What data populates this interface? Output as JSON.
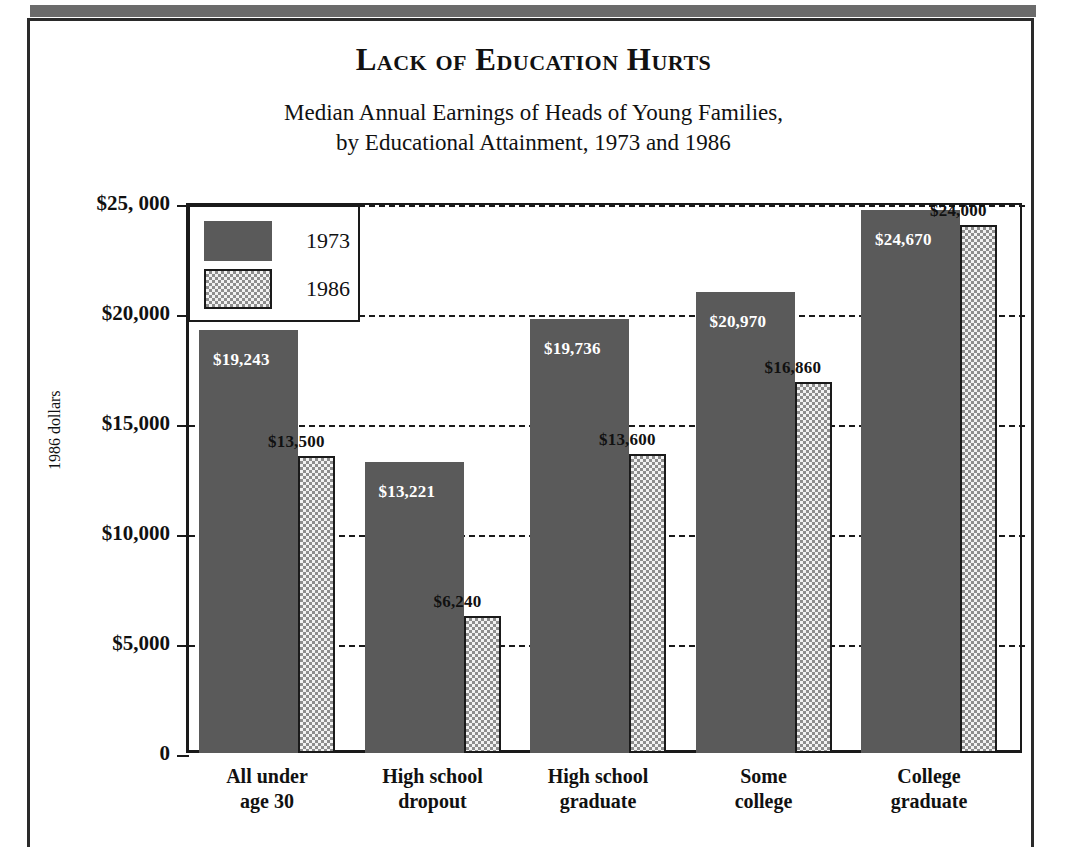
{
  "figure": {
    "title": "Lack of Education Hurts",
    "subtitle_line1": "Median Annual Earnings of Heads of Young Families,",
    "subtitle_line2": "by Educational Attainment, 1973 and 1986"
  },
  "colors": {
    "series_1973": "#5a5a5a",
    "series_1986_fill": "#f2f2f2",
    "series_1986_pattern": "#8d8d8d",
    "axis": "#1a1a1a",
    "banner": "#6b6b6b",
    "text": "#111111"
  },
  "legend": {
    "position": "top-left-inside",
    "entries": [
      {
        "label": "1973",
        "style": "solid-dark-gray"
      },
      {
        "label": "1986",
        "style": "checkered-light"
      }
    ]
  },
  "chart_data": {
    "type": "bar",
    "title": "Lack of Education Hurts",
    "subtitle": "Median Annual Earnings of Heads of Young Families, by Educational Attainment, 1973 and 1986",
    "xlabel": "",
    "ylabel": "1986 dollars",
    "ylim": [
      0,
      25000
    ],
    "grid": true,
    "grid_axis": "y",
    "legend_position": "upper left",
    "ytick_labels": [
      "0",
      "$5,000",
      "$10,000",
      "$15,000",
      "$20,000",
      "$25, 000"
    ],
    "ytick_values": [
      0,
      5000,
      10000,
      15000,
      20000,
      25000
    ],
    "categories": [
      "All under age 30",
      "High school dropout",
      "High school graduate",
      "Some college",
      "College graduate"
    ],
    "category_lines": [
      [
        "All under",
        "age 30"
      ],
      [
        "High school",
        "dropout"
      ],
      [
        "High school",
        "graduate"
      ],
      [
        "Some",
        "college"
      ],
      [
        "College",
        "graduate"
      ]
    ],
    "series": [
      {
        "name": "1973",
        "values": [
          19243,
          13221,
          19736,
          20970,
          24670
        ],
        "data_labels": [
          "$19,243",
          "$13,221",
          "$19,736",
          "$20,970",
          "$24,670"
        ],
        "label_placement": "inside-top-white"
      },
      {
        "name": "1986",
        "values": [
          13500,
          6240,
          13600,
          16860,
          24000
        ],
        "data_labels": [
          "$13,500",
          "$6,240",
          "$13,600",
          "$16,860",
          "$24,000"
        ],
        "label_placement": "above-bar-black"
      }
    ]
  }
}
